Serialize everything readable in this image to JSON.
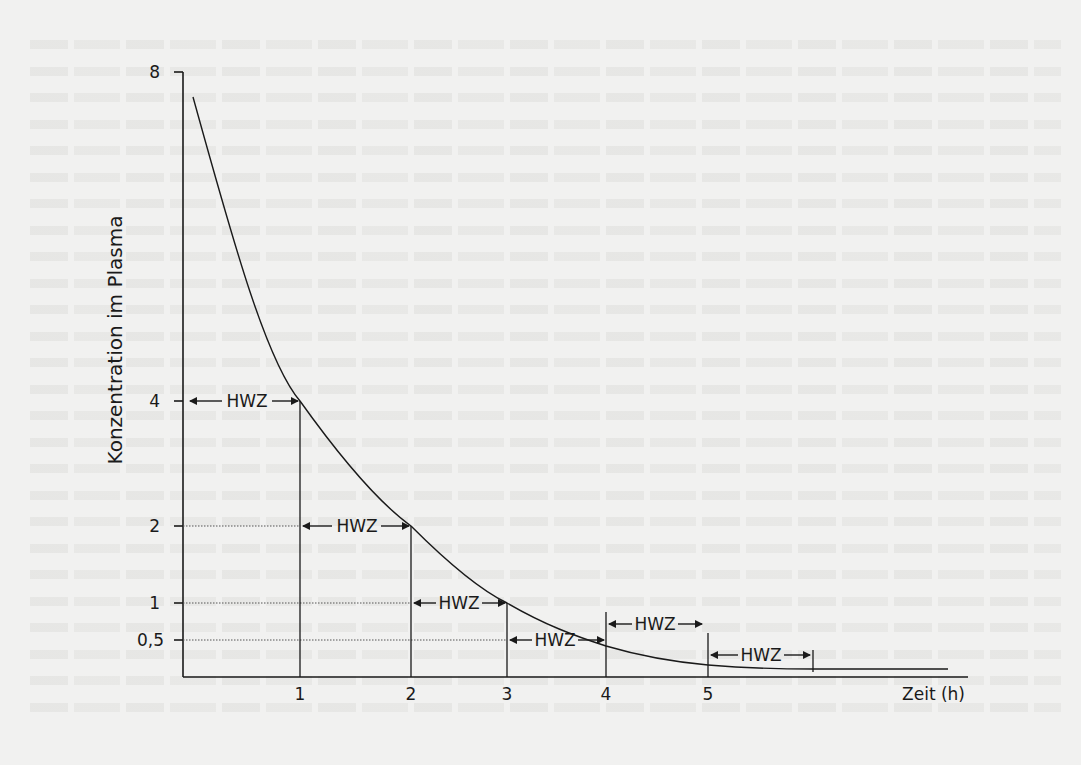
{
  "chart_data": {
    "type": "line",
    "title": "",
    "xlabel": "Zeit (h)",
    "ylabel": "Konzentration im Plasma",
    "x_ticks": [
      "1",
      "2",
      "3",
      "4",
      "5"
    ],
    "y_ticks": [
      "8",
      "4",
      "2",
      "1",
      "0,5"
    ],
    "y_scale_note": "non-linear (halving intervals)",
    "series": [
      {
        "name": "Plasmakonzentration",
        "x": [
          0,
          1,
          2,
          3,
          4,
          5,
          6
        ],
        "y": [
          8,
          4,
          2,
          1,
          0.5,
          0.25,
          0.125
        ]
      }
    ],
    "annotations": [
      {
        "text": "HWZ",
        "from_x": 0,
        "to_x": 1,
        "at_y": 4
      },
      {
        "text": "HWZ",
        "from_x": 1,
        "to_x": 2,
        "at_y": 2
      },
      {
        "text": "HWZ",
        "from_x": 2,
        "to_x": 3,
        "at_y": 1
      },
      {
        "text": "HWZ",
        "from_x": 3,
        "to_x": 4,
        "at_y": 0.5
      },
      {
        "text": "HWZ",
        "from_x": 4,
        "to_x": 5,
        "at_y": 0.25
      },
      {
        "text": "HWZ",
        "from_x": 5,
        "to_x": 6,
        "at_y": 0.125
      }
    ],
    "grid": false,
    "dotted_reference_lines": [
      "2",
      "1",
      "0,5"
    ],
    "legend": null
  },
  "labels": {
    "ylabel": "Konzentration im Plasma",
    "xlabel": "Zeit (h)",
    "hwz": "HWZ",
    "yt8": "8",
    "yt4": "4",
    "yt2": "2",
    "yt1": "1",
    "yt05": "0,5",
    "xt1": "1",
    "xt2": "2",
    "xt3": "3",
    "xt4": "4",
    "xt5": "5"
  }
}
